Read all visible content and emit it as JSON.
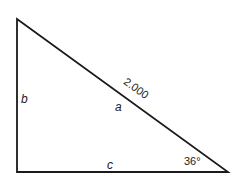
{
  "diagram": {
    "type": "right-triangle",
    "colors": {
      "stroke": "#1a1a1a",
      "text": "#222222",
      "background": "#ffffff"
    },
    "vertices": {
      "top_left": [
        17,
        19
      ],
      "bottom_left": [
        17,
        172
      ],
      "bottom_right": [
        228,
        172
      ]
    },
    "labels": {
      "side_vertical": "b",
      "side_hypotenuse": "a",
      "side_base": "c",
      "hypotenuse_length": "2.000",
      "angle": "36°"
    }
  }
}
